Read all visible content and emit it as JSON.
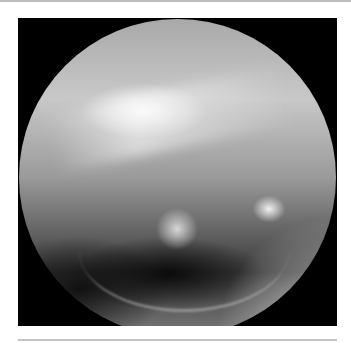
{
  "image": {
    "description": "Circular grayscale endoscopic/otoscopic view of tissue with bright specular highlight band across upper region and dark shadowed lower region",
    "colors": {
      "frame_background": "#000000",
      "page_background": "#ffffff",
      "rule_color": "#bdbdbd"
    }
  }
}
